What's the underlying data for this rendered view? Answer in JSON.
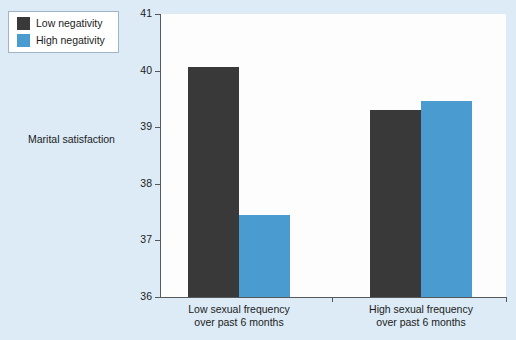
{
  "chart_data": {
    "type": "bar",
    "title": "",
    "xlabel": "",
    "ylabel": "Marital satisfaction",
    "ylim": [
      36,
      41
    ],
    "ytick_step": 1,
    "ytick_labels": [
      "41",
      "40",
      "39",
      "38",
      "37",
      "36"
    ],
    "grid": false,
    "legend_position": "top-left",
    "categories": [
      "Low sexual frequency over past 6 months",
      "High sexual frequency over past 6 months"
    ],
    "category_lines": [
      [
        "Low sexual frequency",
        "over past 6 months"
      ],
      [
        "High sexual frequency",
        "over past 6 months"
      ]
    ],
    "series": [
      {
        "name": "Low negativity",
        "color": "#393939",
        "values": [
          40.07,
          39.31
        ]
      },
      {
        "name": "High negativity",
        "color": "#4a9bcf",
        "values": [
          37.44,
          39.47
        ]
      }
    ]
  },
  "legend": {
    "items": [
      {
        "label": "Low negativity",
        "color": "#393939"
      },
      {
        "label": "High negativity",
        "color": "#4a9bcf"
      }
    ]
  },
  "axes": {
    "y_title": "Marital satisfaction",
    "y_ticks": [
      "41",
      "40",
      "39",
      "38",
      "37",
      "36"
    ]
  },
  "colors": {
    "background": "#dcebf6",
    "plot_background": "#fdfdfd",
    "axis": "#55595c",
    "series_low_negativity": "#393939",
    "series_high_negativity": "#4a9bcf",
    "text": "#1b1b1b"
  }
}
